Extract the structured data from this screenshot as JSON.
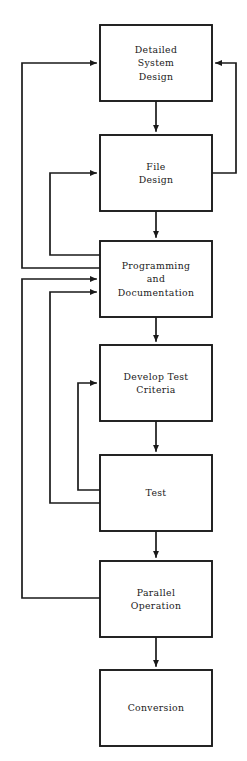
{
  "diagram": {
    "background_color": "#ffffff",
    "line_color": "#1a1a1a",
    "box_fill": "#ffffff",
    "boxes": [
      {
        "id": "detailed-system-design",
        "label": "Detailed System Design",
        "lines": [
          "Detailed",
          "System",
          "Design"
        ],
        "x": 100,
        "y": 25,
        "w": 112,
        "h": 76
      },
      {
        "id": "file-design",
        "label": "File Design",
        "lines": [
          "File",
          "Design"
        ],
        "x": 100,
        "y": 135,
        "w": 112,
        "h": 76
      },
      {
        "id": "programming-and-documentation",
        "label": "Programming and Documentation",
        "lines": [
          "Programming",
          "and",
          "Documentation"
        ],
        "x": 100,
        "y": 241,
        "w": 112,
        "h": 76
      },
      {
        "id": "develop-test-criteria",
        "label": "Develop Test Criteria",
        "lines": [
          "Develop Test",
          "Criteria"
        ],
        "x": 100,
        "y": 345,
        "w": 112,
        "h": 76
      },
      {
        "id": "test",
        "label": "Test",
        "lines": [
          "Test"
        ],
        "x": 100,
        "y": 455,
        "w": 112,
        "h": 76
      },
      {
        "id": "parallel-operation",
        "label": "Parallel Operation",
        "lines": [
          "Parallel",
          "Operation"
        ],
        "x": 100,
        "y": 561,
        "w": 112,
        "h": 76
      },
      {
        "id": "conversion",
        "label": "Conversion",
        "lines": [
          "Conversion"
        ],
        "x": 100,
        "y": 670,
        "w": 112,
        "h": 76
      }
    ],
    "forward_arrows": [
      {
        "id": "arrow-dsd-to-file",
        "from": "detailed-system-design",
        "to": "file-design",
        "path": "M 156 101 L 156 131"
      },
      {
        "id": "arrow-file-to-prog",
        "from": "file-design",
        "to": "programming-and-documentation",
        "path": "M 156 211 L 156 237"
      },
      {
        "id": "arrow-prog-to-dtc",
        "from": "programming-and-documentation",
        "to": "develop-test-criteria",
        "path": "M 156 317 L 156 341"
      },
      {
        "id": "arrow-dtc-to-test",
        "from": "develop-test-criteria",
        "to": "test",
        "path": "M 156 421 L 156 451"
      },
      {
        "id": "arrow-test-to-parallel",
        "from": "test",
        "to": "parallel-operation",
        "path": "M 156 531 L 156 557"
      },
      {
        "id": "arrow-parallel-to-conversion",
        "from": "parallel-operation",
        "to": "conversion",
        "path": "M 156 637 L 156 666"
      }
    ],
    "feedback_loops": [
      {
        "id": "loop-file-to-dsd-right",
        "from": "file-design",
        "to": "detailed-system-design",
        "side": "right",
        "path": "M 212 173 L 236 173 L 236 63 L 216 63"
      },
      {
        "id": "loop-prog-to-dsd-left",
        "from": "programming-and-documentation",
        "to": "detailed-system-design",
        "side": "left",
        "path": "M 100 268 L 22 268 L 22 63 L 96 63"
      },
      {
        "id": "loop-prog-to-file-left",
        "from": "programming-and-documentation",
        "to": "file-design",
        "side": "left",
        "path": "M 100 255 L 50 255 L 50 173 L 96 173"
      },
      {
        "id": "loop-test-to-prog-left",
        "from": "test",
        "to": "programming-and-documentation",
        "side": "left",
        "path": "M 100 503 L 50 503 L 50 292 L 96 292"
      },
      {
        "id": "loop-parallel-to-prog-left",
        "from": "parallel-operation",
        "to": "programming-and-documentation",
        "side": "left",
        "path": "M 100 598 L 22 598 L 22 279 L 96 279"
      },
      {
        "id": "loop-test-to-dtc-left",
        "from": "test",
        "to": "develop-test-criteria",
        "side": "left",
        "path": "M 100 490 L 78 490 L 78 383 L 96 383"
      }
    ]
  }
}
